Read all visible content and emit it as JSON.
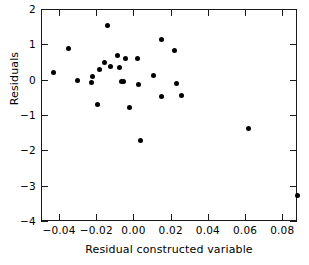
{
  "chart_data": {
    "type": "scatter",
    "title": "",
    "xlabel": "Residual constructed variable",
    "ylabel": "Residuals",
    "xlim": [
      -0.0497,
      0.0879
    ],
    "ylim": [
      -4,
      2
    ],
    "grid": false,
    "legend": null,
    "xticks": [
      -0.04,
      -0.02,
      0.0,
      0.02,
      0.04,
      0.06,
      0.08
    ],
    "xticklabels": [
      "-0.04",
      "-0.02",
      "0.00",
      "0.02",
      "0.04",
      "0.06",
      "0.08"
    ],
    "yticks": [
      2,
      1,
      0,
      -1,
      -2,
      -3,
      -4
    ],
    "yticklabels": [
      "2",
      "1",
      "0",
      "-1",
      "-2",
      "-3",
      "-4"
    ],
    "marker": "filled-circle",
    "marker_color": "#000000",
    "points": [
      {
        "x": -0.0435,
        "y": 0.23
      },
      {
        "x": -0.0357,
        "y": 0.92
      },
      {
        "x": -0.0305,
        "y": 0.0
      },
      {
        "x": -0.0233,
        "y": -0.05
      },
      {
        "x": -0.0224,
        "y": 0.12
      },
      {
        "x": -0.0201,
        "y": -0.68
      },
      {
        "x": -0.019,
        "y": 0.33
      },
      {
        "x": -0.0163,
        "y": 0.52
      },
      {
        "x": -0.0147,
        "y": 1.56
      },
      {
        "x": -0.013,
        "y": 0.4
      },
      {
        "x": -0.0093,
        "y": 0.72
      },
      {
        "x": -0.0082,
        "y": 0.37
      },
      {
        "x": -0.0071,
        "y": -0.02
      },
      {
        "x": -0.0058,
        "y": -0.02
      },
      {
        "x": -0.005,
        "y": 0.62
      },
      {
        "x": -0.0029,
        "y": -0.76
      },
      {
        "x": 0.0016,
        "y": 0.62
      },
      {
        "x": 0.0021,
        "y": -0.11
      },
      {
        "x": 0.0034,
        "y": -1.69
      },
      {
        "x": 0.01,
        "y": 0.15
      },
      {
        "x": 0.0145,
        "y": 1.16
      },
      {
        "x": 0.0147,
        "y": -0.46
      },
      {
        "x": 0.0217,
        "y": 0.85
      },
      {
        "x": 0.0228,
        "y": -0.09
      },
      {
        "x": 0.0252,
        "y": -0.42
      },
      {
        "x": 0.0613,
        "y": -1.36
      },
      {
        "x": 0.0878,
        "y": -3.26
      }
    ]
  }
}
